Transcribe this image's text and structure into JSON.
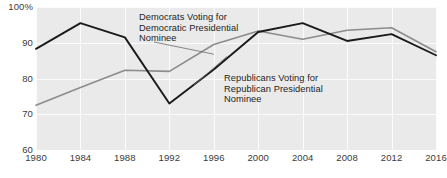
{
  "chart_data": {
    "type": "line",
    "title": "",
    "xlabel": "",
    "ylabel": "",
    "categories": [
      "1980",
      "1984",
      "1988",
      "1992",
      "1996",
      "2000",
      "2004",
      "2008",
      "2012",
      "2016"
    ],
    "x": [
      1980,
      1984,
      1988,
      1992,
      1996,
      2000,
      2004,
      2008,
      2012,
      2016
    ],
    "xlim": [
      1980,
      2016
    ],
    "ylim": [
      60,
      100
    ],
    "grid": true,
    "legend": "annotations-inline",
    "y_tick_labels": [
      "100%",
      "90",
      "80",
      "70",
      "60"
    ],
    "y_tick_values": [
      100,
      90,
      80,
      70,
      60
    ],
    "series": [
      {
        "name": "Democrats Voting for Democratic Presidential Nominee",
        "color": "#8c8c8c",
        "values": [
          72.5,
          77.5,
          82.3,
          82.0,
          89.5,
          93.3,
          91.0,
          93.5,
          94.2,
          87.5
        ]
      },
      {
        "name": "Republicans Voting for Republican Presidential Nominee",
        "color": "#1a1a1a",
        "values": [
          88.3,
          95.5,
          91.5,
          73.0,
          82.5,
          93.0,
          95.5,
          90.5,
          92.4,
          86.5
        ]
      }
    ],
    "annotations": [
      {
        "id": "democrats",
        "text": "Democrats Voting for\nDemocratic Presidential\nNominee",
        "anchor_year": 1996,
        "anchor_value": 86.5
      },
      {
        "id": "republicans",
        "text": "Republicans Voting for\nRepublican Presidential\nNominee",
        "anchor_year": 1997.5,
        "anchor_value": 86.0
      }
    ],
    "colors": {
      "plot_background": "#eaeaea",
      "gridline": "#fbfbfb",
      "page_background": "#ffffff",
      "tick_text": "#3a3a3a",
      "annotation_text": "#1d1d1d",
      "leader_line": "#6a6a6a"
    }
  }
}
